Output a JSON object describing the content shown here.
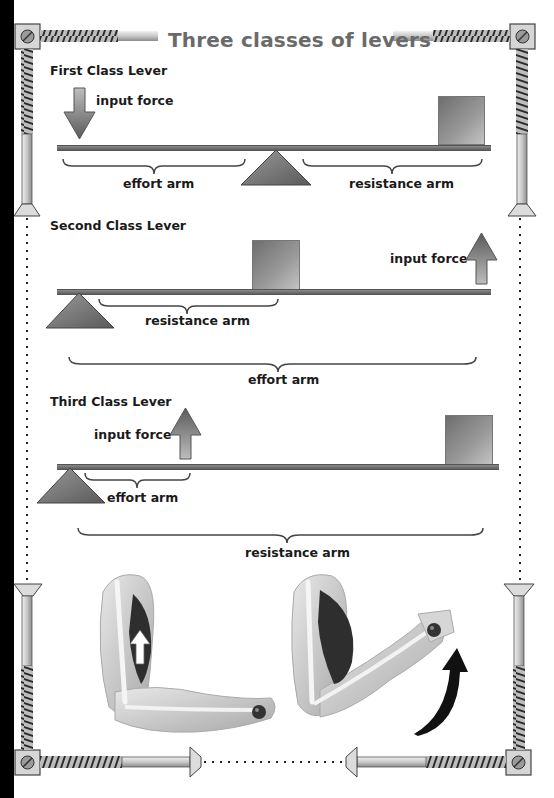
{
  "title": "Three classes of levers",
  "levers": [
    {
      "name": "First Class Lever",
      "input_force_label": "input force",
      "effort_arm_label": "effort arm",
      "resistance_arm_label": "resistance arm",
      "input_force_direction": "down",
      "fulcrum_position": "middle"
    },
    {
      "name": "Second Class Lever",
      "input_force_label": "input force",
      "effort_arm_label": "effort arm",
      "resistance_arm_label": "resistance arm",
      "input_force_direction": "up",
      "fulcrum_position": "left end"
    },
    {
      "name": "Third Class Lever",
      "input_force_label": "input force",
      "effort_arm_label": "effort arm",
      "resistance_arm_label": "resistance arm",
      "input_force_direction": "up",
      "fulcrum_position": "left end"
    }
  ],
  "illustrations": [
    {
      "name": "arm-extended-muscle-contracting",
      "arrow": "up-white"
    },
    {
      "name": "arm-flexed-forearm-raised",
      "arrow": "curved-up-black"
    }
  ],
  "colors": {
    "title": "#6a6a6a",
    "text": "#1a1a1a",
    "beam": "#6e6e6e",
    "fulcrum": "#7a7a7a",
    "frame_edge": "#000000"
  }
}
